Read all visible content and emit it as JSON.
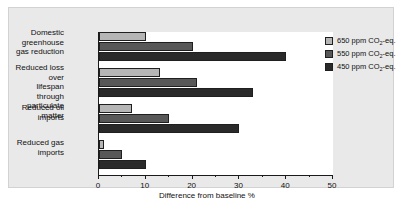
{
  "chart_data": {
    "type": "bar",
    "orientation": "horizontal",
    "title": "",
    "xlabel": "Difference from baseline %",
    "ylabel": "",
    "xlim": [
      0,
      50
    ],
    "xticks": [
      0,
      10,
      20,
      30,
      40,
      50
    ],
    "xtick_labels": [
      "0",
      "10",
      "20",
      "30",
      "40",
      "50"
    ],
    "grid": false,
    "legend_position": "right",
    "categories": [
      "Domestic\ngreenhouse\ngas reduction",
      "Reduced loss over\nlifespan through\nparticulate matter",
      "Reduced oil\nimports",
      "Reduced gas\nimports"
    ],
    "series": [
      {
        "name": "650 ppm CO2-eq.",
        "label_prefix": "650 ppm CO",
        "label_sub": "2",
        "label_suffix": "-eq.",
        "color": "#b5b5b5",
        "values": [
          10,
          13,
          7,
          1
        ]
      },
      {
        "name": "550 ppm CO2-eq.",
        "label_prefix": "550 ppm CO",
        "label_sub": "2",
        "label_suffix": "-eq.",
        "color": "#585858",
        "values": [
          20,
          21,
          15,
          5
        ]
      },
      {
        "name": "450 ppm CO2-eq.",
        "label_prefix": "450 ppm CO",
        "label_sub": "2",
        "label_suffix": "-eq.",
        "color": "#2a2a2a",
        "values": [
          40,
          33,
          30,
          10
        ]
      }
    ]
  },
  "figure": {
    "panel_background": "#e9e9e9",
    "plot_background": "#ffffff",
    "axis_color": "#1a1a1a"
  }
}
